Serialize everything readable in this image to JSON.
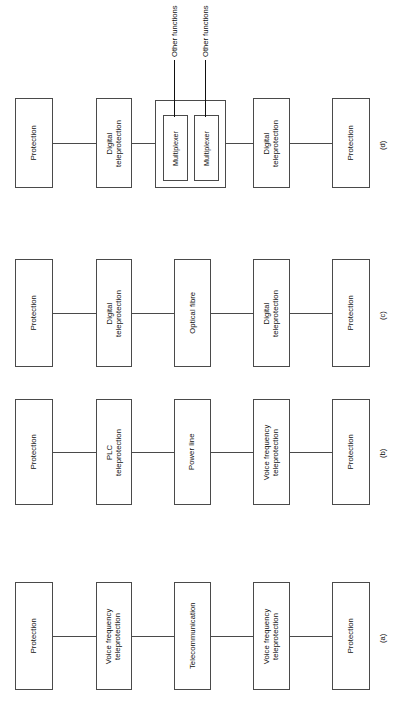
{
  "figure": {
    "orientation": "rotated-90-ccw",
    "line_color": "#4a4a4a",
    "text_color": "#111111",
    "background": "#ffffff"
  },
  "rows": [
    {
      "caption": "(d)",
      "boxes": [
        {
          "label": "Protection"
        },
        {
          "label": "Digital\nteleprotection"
        },
        {
          "label": "Digital\nteleprotection"
        },
        {
          "label": "Protection"
        }
      ],
      "group": {
        "inner_boxes": [
          {
            "label": "Multiplexer"
          },
          {
            "label": "Multiplexer"
          }
        ],
        "stub_labels": [
          "Other functions",
          "Other functions"
        ]
      }
    },
    {
      "caption": "(c)",
      "boxes": [
        {
          "label": "Protection"
        },
        {
          "label": "Digital\nteleprotection"
        },
        {
          "label": "Optical fibre"
        },
        {
          "label": "Digital\nteleprotection"
        },
        {
          "label": "Protection"
        }
      ]
    },
    {
      "caption": "(b)",
      "boxes": [
        {
          "label": "Protection"
        },
        {
          "label": "PLC\nteleprotection"
        },
        {
          "label": "Power line"
        },
        {
          "label": "Voice frequency\nteleprotection"
        },
        {
          "label": "Protection"
        }
      ]
    },
    {
      "caption": "(a)",
      "boxes": [
        {
          "label": "Protection"
        },
        {
          "label": "Voice frequency\nteleprotection"
        },
        {
          "label": "Telecommunication"
        },
        {
          "label": "Voice frequency\nteleprotection"
        },
        {
          "label": "Protection"
        }
      ]
    }
  ]
}
